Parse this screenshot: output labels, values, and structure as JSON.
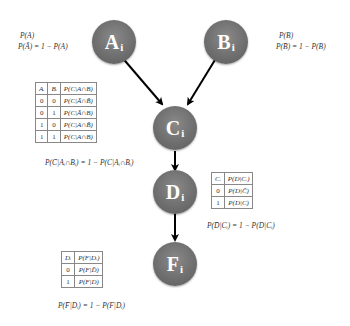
{
  "nodes": {
    "A": {
      "letter": "A",
      "sub": "i"
    },
    "B": {
      "letter": "B",
      "sub": "i"
    },
    "C": {
      "letter": "C",
      "sub": "i"
    },
    "D": {
      "letter": "D",
      "sub": "i"
    },
    "F": {
      "letter": "F",
      "sub": "i"
    }
  },
  "edges": [
    {
      "from": "A",
      "to": "C"
    },
    {
      "from": "B",
      "to": "C"
    },
    {
      "from": "C",
      "to": "D"
    },
    {
      "from": "D",
      "to": "F"
    }
  ],
  "priors": {
    "A": {
      "line1": "P(A)",
      "line2": "P(Ā) = 1 − P(A)"
    },
    "B": {
      "line1": "P(B)",
      "line2": "P(B̄) = 1 − P(B)"
    }
  },
  "table_C": {
    "headers": [
      "Aᵢ",
      "Bᵢ",
      "P(C|A∩B)"
    ],
    "rows": [
      [
        "0",
        "0",
        "P(C|Ā∩B̄)"
      ],
      [
        "0",
        "1",
        "P(C|Ā∩B)"
      ],
      [
        "1",
        "0",
        "P(C|A∩B̄)"
      ],
      [
        "1",
        "1",
        "P(C|A∩B)"
      ]
    ],
    "complement": "P(C̄|Aᵢ∩Bᵢ) = 1 − P(C|Aᵢ∩Bᵢ)"
  },
  "table_D": {
    "headers": [
      "Cᵢ",
      "P(D|Cᵢ)"
    ],
    "rows": [
      [
        "0",
        "P(D|C̄)"
      ],
      [
        "1",
        "P(D|C)"
      ]
    ],
    "complement": "P(D̄|Cᵢ) = 1 − P(D|Cᵢ)"
  },
  "table_F": {
    "headers": [
      "Dᵢ",
      "P(F|Dᵢ)"
    ],
    "rows": [
      [
        "0",
        "P(F|D̄)"
      ],
      [
        "1",
        "P(F|D)"
      ]
    ],
    "complement": "P(F̄|Dᵢ) = 1 − P(F|Dᵢ)"
  },
  "colors": {
    "node_fill": "#6f6f6f",
    "node_text": "#ffffff",
    "edge": "#000000",
    "table_border": "#888888"
  }
}
